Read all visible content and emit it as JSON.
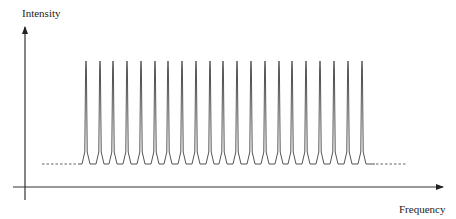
{
  "chart_data": {
    "type": "line",
    "title": "",
    "xlabel": "Frequency",
    "ylabel": "Intensity",
    "peak_count": 21,
    "peak_positions_px": [
      86,
      100,
      113,
      127,
      141,
      155,
      168,
      182,
      196,
      210,
      223,
      237,
      251,
      265,
      279,
      292,
      306,
      320,
      334,
      348,
      362
    ],
    "peak_spacing_px": 13.8,
    "peak_top_y_px": 61,
    "baseline_y_px": 164,
    "peak_half_base_px": 4,
    "relative_peak_intensity": 1.0,
    "baseline_level": 0.0,
    "dashed_baseline_left_px": [
      42,
      77
    ],
    "dashed_baseline_right_px": [
      376,
      406
    ],
    "solid_baseline_px": [
      78,
      375
    ],
    "axes": {
      "origin_px": [
        25,
        187
      ],
      "x_axis_start_px": 13,
      "x_axis_end_px": 443,
      "y_axis_top_px": 27,
      "y_axis_bottom_px": 200,
      "ticks": false,
      "grid": false
    },
    "legend": null
  },
  "colors": {
    "axis": "#333333",
    "trace": "#555555",
    "label": "#222222"
  }
}
